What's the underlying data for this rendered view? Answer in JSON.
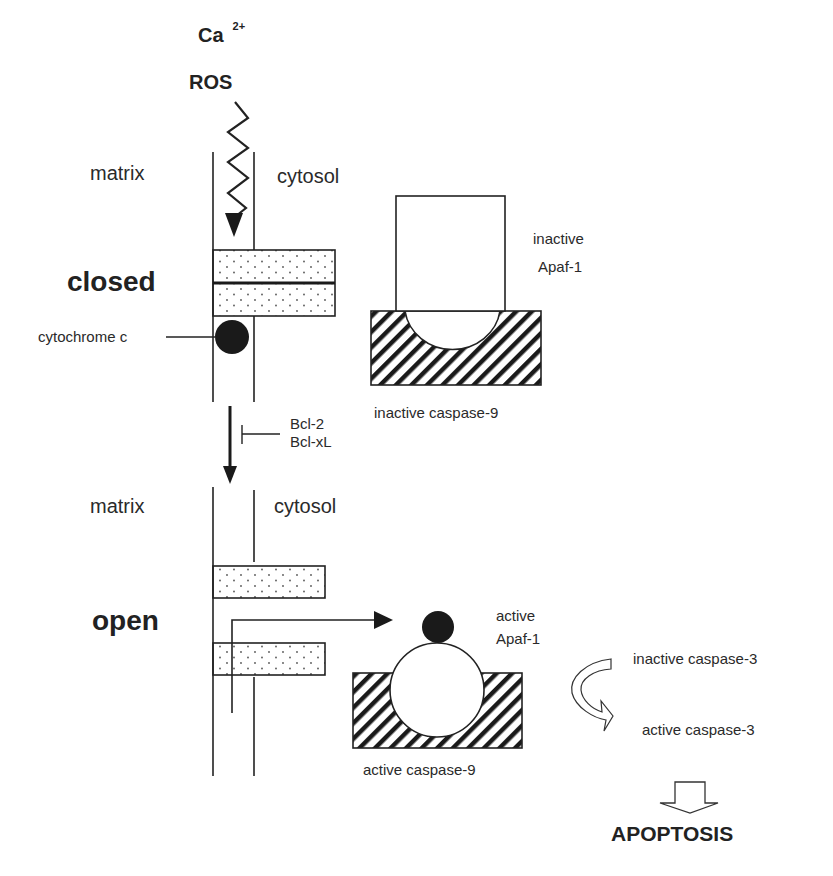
{
  "stimuli": {
    "calcium": "Ca",
    "calcium_charge": "2+",
    "ros": "ROS"
  },
  "closed_state": {
    "matrix_label": "matrix",
    "cytosol_label": "cytosol",
    "state_label": "closed",
    "cytochrome_label": "cytochrome c",
    "apaf_label_line1": "inactive",
    "apaf_label_line2": "Apaf-1",
    "caspase9_label": "inactive caspase-9"
  },
  "transition": {
    "inhibitor_line1": "Bcl-2",
    "inhibitor_line2": "Bcl-xL"
  },
  "open_state": {
    "matrix_label": "matrix",
    "cytosol_label": "cytosol",
    "state_label": "open",
    "apaf_label_line1": "active",
    "apaf_label_line2": "Apaf-1",
    "caspase9_label": "active caspase-9"
  },
  "caspase3": {
    "inactive_label": "inactive caspase-3",
    "active_label": "active caspase-3"
  },
  "outcome": {
    "label": "APOPTOSIS"
  },
  "colors": {
    "line": "#222222",
    "fill_dark": "#1a1a1a",
    "dots": "#555555"
  }
}
